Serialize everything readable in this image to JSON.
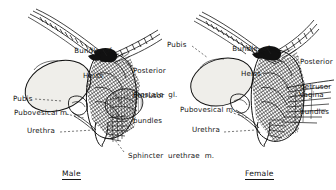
{
  "figure": {
    "panels": [
      {
        "id": "male",
        "caption": "Male",
        "labels": [
          {
            "name": "bundle-of-heiss",
            "lines": [
              "Bundle  of",
              "Heiss"
            ]
          },
          {
            "name": "posterior-detrusor-bundles",
            "lines": [
              "Posterior",
              "detrusor",
              "bundles"
            ]
          },
          {
            "name": "prostate-gland",
            "lines": [
              "Prostate  gl."
            ]
          },
          {
            "name": "pubis",
            "lines": [
              "Pubis"
            ]
          },
          {
            "name": "pubovesical-muscle",
            "lines": [
              "Pubovesical m."
            ]
          },
          {
            "name": "urethra",
            "lines": [
              "Urethra"
            ]
          },
          {
            "name": "sphincter-urethrae-muscle",
            "lines": [
              "Sphincter  urethrae  m."
            ]
          }
        ]
      },
      {
        "id": "female",
        "caption": "Female",
        "labels": [
          {
            "name": "pubis",
            "lines": [
              "Pubis"
            ]
          },
          {
            "name": "bundle-of-heiss",
            "lines": [
              "Bundle  of",
              "Heiss"
            ]
          },
          {
            "name": "posterior-detrusor-bundles",
            "lines": [
              "Posterior",
              "detrusor",
              "bundles"
            ]
          },
          {
            "name": "vagina",
            "lines": [
              "Vagina"
            ]
          },
          {
            "name": "pubovesical-muscle",
            "lines": [
              "Pubovesical m."
            ]
          },
          {
            "name": "urethra",
            "lines": [
              "Urethra"
            ]
          }
        ]
      }
    ],
    "text": {
      "male_bundle_l1": "Bundle  of",
      "male_bundle_l2": "Heiss",
      "male_post_l1": "Posterior",
      "male_post_l2": "detrusor",
      "male_post_l3": "bundles",
      "male_prostate": "Prostate  gl.",
      "male_pubis": "Pubis",
      "male_pubovesical": "Pubovesical m.",
      "male_urethra": "Urethra",
      "male_sphincter": "Sphincter  urethrae  m.",
      "male_caption": "Male",
      "female_pubis": "Pubis",
      "female_bundle_l1": "Bundle  of",
      "female_bundle_l2": "Heiss",
      "female_post_l1": "Posterior",
      "female_post_l2": "detrusor",
      "female_post_l3": "bundles",
      "female_vagina": "Vagina",
      "female_pubovesical": "Pubovesical m.",
      "female_urethra": "Urethra",
      "female_caption": "Female"
    },
    "colors": {
      "ink": "#111111",
      "paper": "#ffffff",
      "pale_fill": "#efeeea",
      "lead_line": "#222222"
    }
  }
}
